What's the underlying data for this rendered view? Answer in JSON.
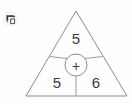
{
  "canvas": {
    "width": 132,
    "height": 104,
    "background": "#fefefe"
  },
  "toolbar": {
    "undo_icon_name": "undo-arrow-icon",
    "undo_label": "Undo"
  },
  "diagram": {
    "type": "triangle-number-puzzle",
    "shape": "triangle",
    "stroke_color": "#8c8c8c",
    "text_color": "#3a3a3a",
    "center": {
      "operator": "+",
      "operator_name": "plus-sign"
    },
    "regions": [
      {
        "position": "top",
        "value": "5"
      },
      {
        "position": "bottom-left",
        "value": "5"
      },
      {
        "position": "bottom-right",
        "value": "6"
      }
    ]
  }
}
